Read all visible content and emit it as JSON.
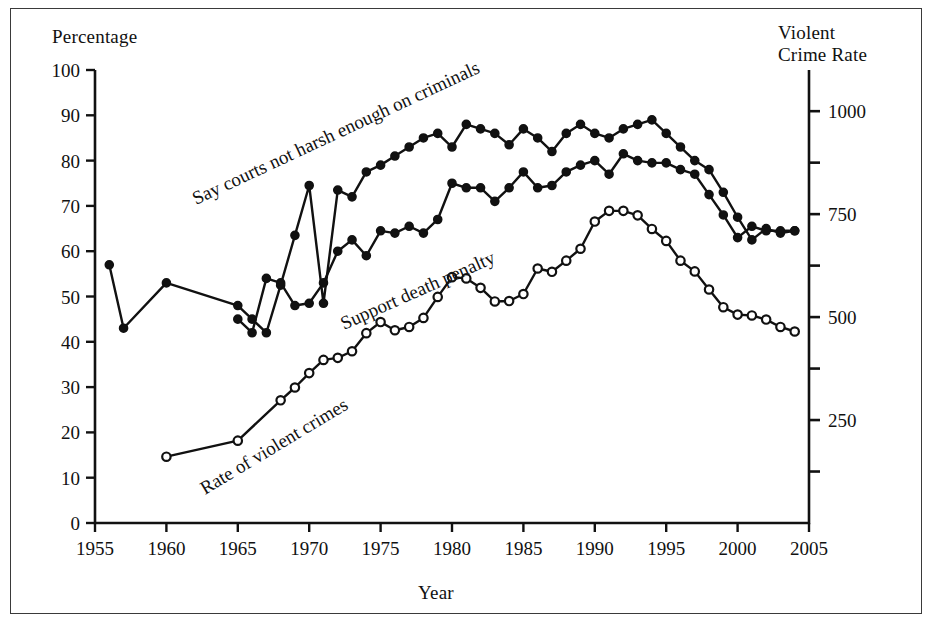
{
  "figure": {
    "background": "#ffffff",
    "frame_color": "#3a3a3a",
    "ink_color": "#111111"
  },
  "labels": {
    "left_axis_title": "Percentage",
    "right_axis_title_line1": "Violent",
    "right_axis_title_line2": "Crime Rate",
    "x_axis_title": "Year"
  },
  "chart_data": {
    "type": "line",
    "title": "",
    "subtitle": "",
    "xlabel": "Year",
    "ylabel": "Percentage",
    "y2label": "Violent Crime Rate",
    "xlim": [
      1955,
      2005
    ],
    "ylim": [
      0,
      100
    ],
    "y2lim": [
      0,
      1100
    ],
    "grid": false,
    "legend_position": "inline-curve-labels",
    "xticks": [
      1955,
      1960,
      1965,
      1970,
      1975,
      1980,
      1985,
      1990,
      1995,
      2000,
      2005
    ],
    "xtick_labels": [
      "1955",
      "1960",
      "1965",
      "1970",
      "1975",
      "1980",
      "1985",
      "1990",
      "1995",
      "2000",
      "2005"
    ],
    "yticks": [
      0,
      10,
      20,
      30,
      40,
      50,
      60,
      70,
      80,
      90,
      100
    ],
    "ytick_labels": [
      "0",
      "10",
      "20",
      "30",
      "40",
      "50",
      "60",
      "70",
      "80",
      "90",
      "100"
    ],
    "y2ticks_major": [
      250,
      500,
      750,
      1000
    ],
    "y2tick_labels": [
      "250",
      "500",
      "750",
      "1000"
    ],
    "y2ticks_minor": [
      125,
      375,
      625,
      875,
      1125
    ],
    "series": [
      {
        "name": "Say courts not harsh enough on criminals",
        "axis": "left",
        "marker": "filled-circle",
        "label_angle": -26,
        "points": [
          [
            1956,
            57
          ],
          [
            1957,
            43
          ],
          [
            1960,
            53
          ],
          [
            1965,
            48
          ],
          [
            1966,
            45
          ],
          [
            1967,
            42
          ],
          [
            1968,
            52.5
          ],
          [
            1969,
            63.5
          ],
          [
            1970,
            74.5
          ],
          [
            1971,
            48.5
          ],
          [
            1972,
            73.5
          ],
          [
            1973,
            72
          ],
          [
            1974,
            77.5
          ],
          [
            1975,
            79
          ],
          [
            1976,
            81
          ],
          [
            1977,
            83
          ],
          [
            1978,
            85
          ],
          [
            1979,
            86
          ],
          [
            1980,
            83
          ],
          [
            1981,
            88
          ],
          [
            1982,
            87
          ],
          [
            1983,
            86
          ],
          [
            1984,
            83.5
          ],
          [
            1985,
            87
          ],
          [
            1986,
            85
          ],
          [
            1987,
            82
          ],
          [
            1988,
            86
          ],
          [
            1989,
            88
          ],
          [
            1990,
            86
          ],
          [
            1991,
            85
          ],
          [
            1992,
            87
          ],
          [
            1993,
            88
          ],
          [
            1994,
            89
          ],
          [
            1995,
            86
          ],
          [
            1996,
            83
          ],
          [
            1997,
            80
          ],
          [
            1998,
            78
          ],
          [
            1999,
            73
          ],
          [
            2000,
            67.5
          ],
          [
            2001,
            62.5
          ],
          [
            2002,
            65
          ],
          [
            2003,
            64
          ],
          [
            2004,
            64.5
          ]
        ]
      },
      {
        "name": "Support death penalty",
        "axis": "left",
        "marker": "filled-circle",
        "label_angle": -26,
        "points": [
          [
            1965,
            45
          ],
          [
            1966,
            42
          ],
          [
            1967,
            54
          ],
          [
            1968,
            53
          ],
          [
            1969,
            48
          ],
          [
            1970,
            48.5
          ],
          [
            1971,
            53
          ],
          [
            1972,
            60
          ],
          [
            1973,
            62.5
          ],
          [
            1974,
            59
          ],
          [
            1975,
            64.5
          ],
          [
            1976,
            64
          ],
          [
            1977,
            65.5
          ],
          [
            1978,
            64
          ],
          [
            1979,
            67
          ],
          [
            1980,
            75
          ],
          [
            1981,
            74
          ],
          [
            1982,
            74
          ],
          [
            1983,
            71
          ],
          [
            1984,
            74
          ],
          [
            1985,
            77.5
          ],
          [
            1986,
            74
          ],
          [
            1987,
            74.5
          ],
          [
            1988,
            77.5
          ],
          [
            1989,
            79
          ],
          [
            1990,
            80
          ],
          [
            1991,
            77
          ],
          [
            1992,
            81.5
          ],
          [
            1993,
            80
          ],
          [
            1994,
            79.5
          ],
          [
            1995,
            79.5
          ],
          [
            1996,
            78
          ],
          [
            1997,
            77
          ],
          [
            1998,
            72.5
          ],
          [
            1999,
            68
          ],
          [
            2000,
            63
          ],
          [
            2001,
            65.5
          ],
          [
            2002,
            64.5
          ],
          [
            2003,
            64.5
          ],
          [
            2004,
            64.5
          ]
        ]
      },
      {
        "name": "Rate of violent crimes",
        "axis": "right",
        "marker": "open-circle",
        "label_angle": -32,
        "points": [
          [
            1960,
            161
          ],
          [
            1965,
            200
          ],
          [
            1968,
            298
          ],
          [
            1969,
            329
          ],
          [
            1970,
            364
          ],
          [
            1971,
            396
          ],
          [
            1972,
            401
          ],
          [
            1973,
            417
          ],
          [
            1974,
            461
          ],
          [
            1975,
            488
          ],
          [
            1976,
            468
          ],
          [
            1977,
            476
          ],
          [
            1978,
            498
          ],
          [
            1979,
            549
          ],
          [
            1980,
            597
          ],
          [
            1981,
            594
          ],
          [
            1982,
            571
          ],
          [
            1983,
            538
          ],
          [
            1984,
            539
          ],
          [
            1985,
            556
          ],
          [
            1986,
            618
          ],
          [
            1987,
            610
          ],
          [
            1988,
            637
          ],
          [
            1989,
            666
          ],
          [
            1990,
            732
          ],
          [
            1991,
            758
          ],
          [
            1992,
            758
          ],
          [
            1993,
            747
          ],
          [
            1994,
            714
          ],
          [
            1995,
            685
          ],
          [
            1996,
            637
          ],
          [
            1997,
            611
          ],
          [
            1998,
            567
          ],
          [
            1999,
            524
          ],
          [
            2000,
            506
          ],
          [
            2001,
            504
          ],
          [
            2002,
            494
          ],
          [
            2003,
            476
          ],
          [
            2004,
            465
          ]
        ]
      }
    ]
  },
  "series_labels": [
    {
      "text": "Say courts not harsh enough on criminals",
      "x": 196,
      "y": 205,
      "angle": -25
    },
    {
      "text": "Support death penalty",
      "x": 344,
      "y": 330,
      "angle": -24
    },
    {
      "text": "Rate of violent crimes",
      "x": 205,
      "y": 495,
      "angle": -31
    }
  ]
}
